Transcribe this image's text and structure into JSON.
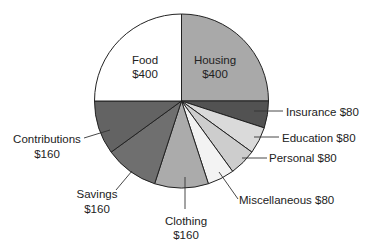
{
  "chart_data": {
    "type": "pie",
    "title": "",
    "start_angle_deg": 90,
    "direction": "clockwise",
    "total": 1600,
    "slices": [
      {
        "label": "Housing",
        "value": 400,
        "value_label": "$400",
        "color": "#a9a9a9",
        "label_inside": true
      },
      {
        "label": "Insurance",
        "value": 80,
        "value_label": "$80",
        "color": "#525252",
        "label_inside": false
      },
      {
        "label": "Education",
        "value": 80,
        "value_label": "$80",
        "color": "#dadada",
        "label_inside": false
      },
      {
        "label": "Personal",
        "value": 80,
        "value_label": "$80",
        "color": "#cdcdcd",
        "label_inside": false
      },
      {
        "label": "Miscellaneous",
        "value": 80,
        "value_label": "$80",
        "color": "#f3f3f3",
        "label_inside": false
      },
      {
        "label": "Clothing",
        "value": 160,
        "value_label": "$160",
        "color": "#ababab",
        "label_inside": false
      },
      {
        "label": "Savings",
        "value": 160,
        "value_label": "$160",
        "color": "#6f6f6f",
        "label_inside": false
      },
      {
        "label": "Contributions",
        "value": 160,
        "value_label": "$160",
        "color": "#636363",
        "label_inside": false
      },
      {
        "label": "Food",
        "value": 400,
        "value_label": "$400",
        "color": "#ffffff",
        "label_inside": true
      }
    ]
  },
  "labels": {
    "housing": {
      "name": "Housing",
      "value": "$400"
    },
    "food": {
      "name": "Food",
      "value": "$400"
    },
    "insurance": "Insurance $80",
    "education": "Education $80",
    "personal": "Personal $80",
    "miscellaneous": "Miscellaneous $80",
    "clothing": {
      "name": "Clothing",
      "value": "$160"
    },
    "savings": {
      "name": "Savings",
      "value": "$160"
    },
    "contributions": {
      "name": "Contributions",
      "value": "$160"
    }
  }
}
